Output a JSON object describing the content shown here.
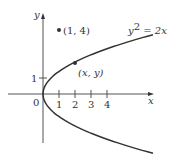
{
  "figure": {
    "axes": {
      "x_label": "x",
      "y_label": "y",
      "origin_label": "0",
      "x_ticks": [
        "1",
        "2",
        "3",
        "4"
      ],
      "y_ticks": [
        "1"
      ]
    },
    "curve": {
      "equation_lhs": "y",
      "equation_exp": "2",
      "equation_rhs": " = 2x"
    },
    "points": [
      {
        "label": "(1, 4)",
        "x": 1,
        "y": 4
      },
      {
        "label": "(x, y)",
        "x": 2,
        "y": 2
      }
    ],
    "colors": {
      "ink": "#333333",
      "axis": "#555555"
    }
  }
}
